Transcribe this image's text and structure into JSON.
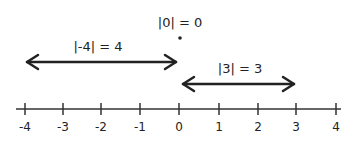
{
  "diagram": {
    "number_line": {
      "min": -4,
      "max": 4,
      "ticks": [
        "-4",
        "-3",
        "-2",
        "-1",
        "0",
        "1",
        "2",
        "3",
        "4"
      ]
    },
    "annotations": {
      "zero": {
        "label": "|0| = 0",
        "point": 0
      },
      "neg_four": {
        "label": "|-4| = 4",
        "from": -4,
        "to": 0
      },
      "three": {
        "label": "|3| = 3",
        "from": 0,
        "to": 3
      }
    },
    "colors": {
      "ink": "#222222",
      "background": "#ffffff"
    }
  }
}
